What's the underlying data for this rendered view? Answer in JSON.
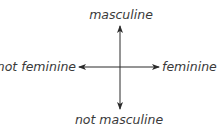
{
  "diagram": {
    "type": "two-axis cross",
    "axes": {
      "vertical": {
        "top_label": "masculine",
        "bottom_label": "not masculine"
      },
      "horizontal": {
        "left_label": "not feminine",
        "right_label": "feminine"
      }
    },
    "colors": {
      "line": "#2b2b2b",
      "text": "#3a3a3a",
      "background": "#ffffff"
    }
  }
}
